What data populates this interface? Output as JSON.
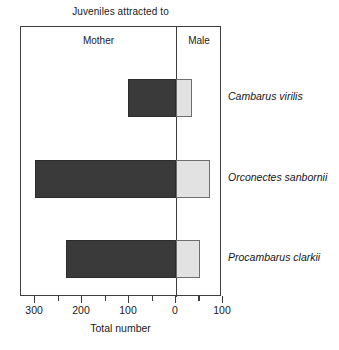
{
  "chart_data": {
    "type": "bar",
    "orientation": "horizontal",
    "layout": "diverging",
    "title": "Juveniles attracted to",
    "xlabel": "Total number",
    "ylabel": "",
    "grid": false,
    "legend_position": "panel-headers",
    "panel_headers": [
      "Mother",
      "Male"
    ],
    "categories": [
      "Cambarus virilis",
      "Orconectes sanbornii",
      "Procambarus clarkii"
    ],
    "axis_ticks_major": [
      300,
      200,
      100,
      0,
      100
    ],
    "axis_ticks_minor": [
      350,
      250,
      150,
      50,
      50
    ],
    "xlim_left": 330,
    "xlim_right": 100,
    "series": [
      {
        "name": "Mother",
        "side": "left",
        "color": "#3a3a3a",
        "values": [
          102,
          300,
          235
        ]
      },
      {
        "name": "Male",
        "side": "right",
        "color": "#e2e2e2",
        "values": [
          35,
          72,
          52
        ]
      }
    ]
  },
  "axis": {
    "tick_labels": [
      "300",
      "200",
      "100",
      "0",
      "100"
    ],
    "title": "Total number"
  },
  "colors": {
    "mother_bar": "#3a3a3a",
    "male_bar": "#e2e2e2",
    "frame": "#3d3d3d",
    "background": "#ffffff"
  }
}
